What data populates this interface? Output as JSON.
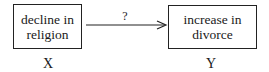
{
  "diagram": {
    "nodes": [
      {
        "id": "X",
        "label_line1": "decline in",
        "label_line2": "religion",
        "variable": "X"
      },
      {
        "id": "Y",
        "label_line1": "increase in",
        "label_line2": "divorce",
        "variable": "Y"
      }
    ],
    "edge": {
      "from": "X",
      "to": "Y",
      "label": "?"
    }
  }
}
